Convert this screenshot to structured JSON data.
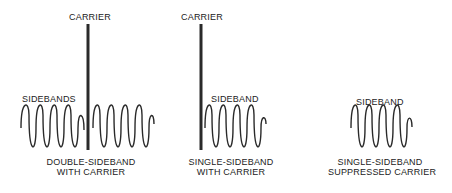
{
  "diagrams": [
    {
      "title_line1": "DOUBLE-SIDEBAND",
      "title_line2": "WITH CARRIER",
      "carrier_label": "CARRIER",
      "sideband_label": "SIDEBANDS"
    },
    {
      "title_line1": "SINGLE-SIDEBAND",
      "title_line2": "WITH CARRIER",
      "carrier_label": "CARRIER",
      "sideband_label": "SIDEBAND"
    },
    {
      "title_line1": "SINGLE-SIDEBAND",
      "title_line2": "SUPPRESSED CARRIER",
      "sideband_label": "SIDEBAND"
    }
  ],
  "colors": {
    "line": "#2a2a2a",
    "text": "#222222",
    "background": "#ffffff"
  }
}
